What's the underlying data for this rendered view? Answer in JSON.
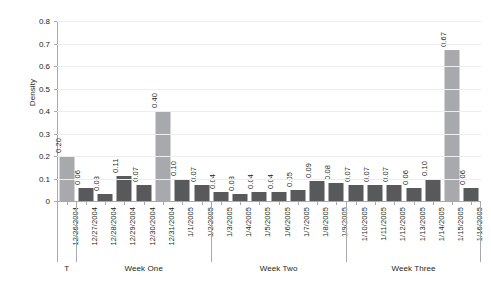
{
  "chart_data": {
    "type": "bar",
    "title": "",
    "xlabel": "",
    "ylabel": "Density",
    "ylim": [
      0,
      0.8
    ],
    "ytick_labels": [
      "0.8",
      "0.7",
      "0.6",
      "0.5",
      "0.4",
      "0.3",
      "0.2",
      "0.1",
      "0"
    ],
    "ytick_values": [
      0.8,
      0.7,
      0.6,
      0.5,
      0.4,
      0.3,
      0.2,
      0.1,
      0
    ],
    "grid": true,
    "legend": "none",
    "categories": [
      "12/26/2004",
      "12/27/2004",
      "12/28/2004",
      "12/29/2004",
      "12/30/2004",
      "12/31/2004",
      "1/1/2005",
      "1/2/2005",
      "1/3/2005",
      "1/4/2005",
      "1/5/2005",
      "1/6/2005",
      "1/7/2005",
      "1/8/2005",
      "1/9/2005",
      "1/10/2005",
      "1/11/2005",
      "1/12/2005",
      "1/13/2005",
      "1/14/2005",
      "1/15/2005",
      "1/16/2005"
    ],
    "values": [
      0.2,
      0.06,
      0.03,
      0.11,
      0.07,
      0.4,
      0.1,
      0.07,
      0.04,
      0.03,
      0.04,
      0.04,
      0.05,
      0.09,
      0.08,
      0.07,
      0.07,
      0.07,
      0.06,
      0.1,
      0.67,
      0.06
    ],
    "value_labels": [
      "0.20",
      "0.06",
      "0.03",
      "0.11",
      "0.07",
      "0.40",
      "0.10",
      "0.07",
      "0.04",
      "0.03",
      "0.04",
      "0.04",
      "0.05",
      "0.09",
      "0.08",
      "0.07",
      "0.07",
      "0.07",
      "0.06",
      "0.10",
      "0.67",
      "0.06"
    ],
    "bar_styles": [
      "light",
      "dark",
      "dark",
      "dark",
      "dark",
      "light",
      "dark",
      "dark",
      "dark",
      "dark",
      "dark",
      "dark",
      "dark",
      "dark",
      "dark",
      "dark",
      "dark",
      "dark",
      "dark",
      "dark",
      "light",
      "dark"
    ],
    "colors": {
      "bar_dark": "#58595b",
      "bar_light": "#a7a9ac",
      "gridline": "#eceded",
      "axis": "#a7a9ac",
      "text": "#231f20",
      "background": "#ffffff"
    },
    "groups": [
      {
        "label": "T",
        "start_index": 0,
        "end_index": 0
      },
      {
        "label": "Week One",
        "start_index": 1,
        "end_index": 7
      },
      {
        "label": "Week Two",
        "start_index": 8,
        "end_index": 14
      },
      {
        "label": "Week Three",
        "start_index": 15,
        "end_index": 21
      }
    ]
  }
}
